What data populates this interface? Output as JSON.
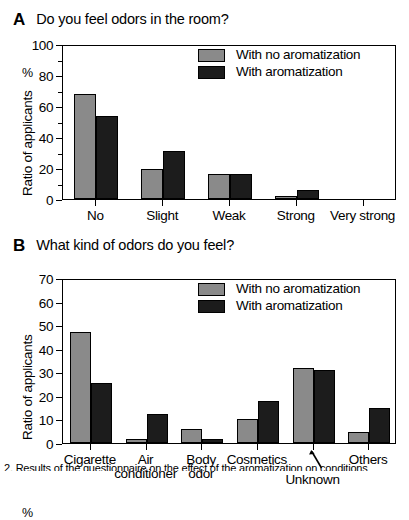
{
  "figure": {
    "caption": "2. Results of the questionnaire on the effect of the aromatization on conditions"
  },
  "panels": [
    {
      "letter": "A",
      "question": "Do you feel odors in the room?",
      "ylabel": "Ratio of applicants",
      "yunit": "%",
      "legend": [
        {
          "label": "With no aromatization",
          "color": "#8a8a8a"
        },
        {
          "label": "With aromatization",
          "color": "#1c1c1c"
        }
      ],
      "chart_data": {
        "type": "bar",
        "title": "Do you feel odors in the room?",
        "xlabel": "",
        "ylabel": "Ratio of applicants",
        "yunit": "%",
        "ylim": [
          0,
          100
        ],
        "ytick_step": 20,
        "yminor_step": 10,
        "grid": false,
        "legend_position": "top-right",
        "categories": [
          "No",
          "Slight",
          "Weak",
          "Strong",
          "Very strong"
        ],
        "series": [
          {
            "name": "With no aromatization",
            "color": "#8a8a8a",
            "values": [
              68,
              19.5,
              16,
              2,
              0
            ]
          },
          {
            "name": "With aromatization",
            "color": "#1c1c1c",
            "values": [
              53.5,
              31,
              16,
              6,
              0
            ]
          }
        ],
        "yticks": [
          0,
          20,
          40,
          60,
          80,
          100
        ]
      }
    },
    {
      "letter": "B",
      "question": "What kind of odors do you feel?",
      "ylabel": "Ratio of applicants",
      "yunit": "%",
      "legend": [
        {
          "label": "With no aromatization",
          "color": "#8a8a8a"
        },
        {
          "label": "With aromatization",
          "color": "#1c1c1c"
        }
      ],
      "annotation": {
        "text": "Unknown",
        "type": "arrow-callout"
      },
      "chart_data": {
        "type": "bar",
        "title": "What kind of odors do you feel?",
        "xlabel": "",
        "ylabel": "Ratio of applicants",
        "yunit": "%",
        "ylim": [
          0,
          70
        ],
        "ytick_step": 10,
        "grid": false,
        "legend_position": "top-right",
        "categories": [
          "Cigarette",
          "Air conditioner",
          "Body odor",
          "Cosmetics",
          "Unknown",
          "Others"
        ],
        "category_lines": [
          [
            "Cigarette"
          ],
          [
            "Air",
            "conditioner"
          ],
          [
            "Body",
            "odor"
          ],
          [
            "Cosmetics"
          ],
          [
            "Unknown"
          ],
          [
            "Others"
          ]
        ],
        "series": [
          {
            "name": "With no aromatization",
            "color": "#8a8a8a",
            "values": [
              47,
              1.8,
              6,
              10,
              32,
              4.5
            ]
          },
          {
            "name": "With aromatization",
            "color": "#1c1c1c",
            "values": [
              25.3,
              12.5,
              1.7,
              18,
              31,
              15
            ]
          }
        ],
        "yticks": [
          0,
          10,
          20,
          30,
          40,
          50,
          60,
          70
        ]
      }
    }
  ]
}
